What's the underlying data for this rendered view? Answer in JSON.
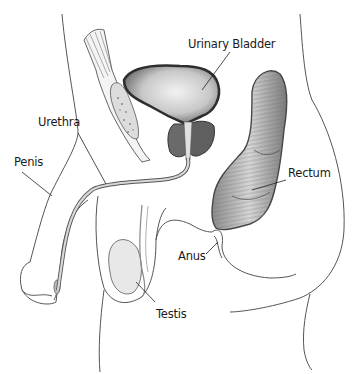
{
  "diagram": {
    "labels": {
      "urinary_bladder": "Urinary Bladder",
      "urethra": "Urethra",
      "penis": "Penis",
      "rectum": "Rectum",
      "anus": "Anus",
      "testis": "Testis"
    },
    "colors": {
      "outline": "#3a3a3a",
      "organ_dark": "#5a5a5a",
      "organ_mid": "#9a9a9a",
      "organ_light": "#e6e6e6",
      "background": "#ffffff",
      "text": "#1a1a1a"
    }
  }
}
